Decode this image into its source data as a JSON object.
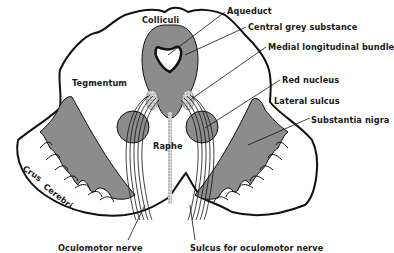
{
  "diagram": {
    "type": "anatomical-cross-section",
    "colors": {
      "outline": "#111111",
      "grey_fill": "#8c8c8c",
      "background": "#ffffff",
      "hatch": "#bdbdbd"
    },
    "labels": {
      "colliculi": "Colliculi",
      "aqueduct": "Aqueduct",
      "central_grey": "Central grey substance",
      "mlf": "Medial longitudinal bundle",
      "tegmentum": "Tegmentum",
      "red_nucleus": "Red nucleus",
      "lateral": "Lateral",
      "sulcus": "sulcus",
      "substantia_nigra": "Substantia nigra",
      "raphe": "Raphe",
      "crus": "Crus",
      "cerebri": "Cerebri",
      "oculomotor_nerve": "Oculomotor nerve",
      "sulcus_oculomotor": "Sulcus for oculomotor nerve"
    }
  }
}
